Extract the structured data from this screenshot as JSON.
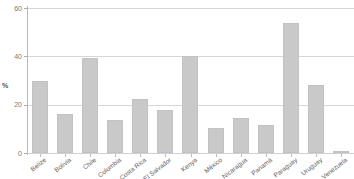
{
  "chart_data": {
    "type": "bar",
    "title": "",
    "subtitle": "",
    "xlabel": "",
    "ylabel": "%",
    "ylim": [
      0,
      60
    ],
    "yticks": [
      0,
      20,
      40,
      60
    ],
    "grid": true,
    "legend": "none",
    "orientation": "vertical",
    "bar_color": "#c9c9c9",
    "categories": [
      "Belize",
      "Bolivia",
      "Chile",
      "Colombia",
      "Costa Rica",
      "El Salvador",
      "Kenya",
      "México",
      "Nicaragua",
      "Panamá",
      "Paraguay",
      "Uruguay",
      "Venezuela"
    ],
    "values": [
      29.6,
      16.3,
      39.5,
      13.5,
      22.4,
      17.8,
      40.3,
      10.3,
      14.3,
      11.7,
      53.8,
      28.1,
      0.3
    ]
  },
  "axes": {
    "y_tick_labels": [
      "0",
      "20",
      "40",
      "60"
    ],
    "y_axis_title": "%"
  },
  "colors": {
    "bar": "#c9c9c9",
    "grid": "#d6d6d6",
    "axis": "#b8b8b8",
    "background": "#ffffff",
    "tick_text": "#777777",
    "label_text": "#5c5c5c"
  }
}
